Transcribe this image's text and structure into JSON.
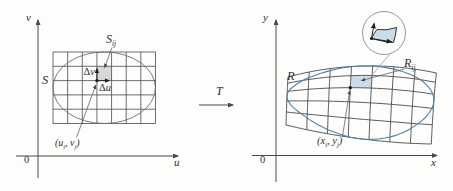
{
  "figure": {
    "left": {
      "v_axis_label": "v",
      "u_axis_label": "u",
      "origin_label": "0",
      "region_label": "S",
      "cell_label": {
        "base": "S",
        "sub": "ij"
      },
      "dv_label": {
        "delta": "Δ",
        "var": "v"
      },
      "du_label": {
        "delta": "Δ",
        "var": "u"
      },
      "point_label": {
        "pre": "(u",
        "sub1": "i",
        "mid": ", v",
        "sub2": "j",
        "post": ")"
      }
    },
    "transform": {
      "label": "T"
    },
    "right": {
      "y_axis_label": "y",
      "x_axis_label": "x",
      "origin_label": "0",
      "region_label": "R",
      "cell_label": {
        "base": "R",
        "sub": "ij"
      },
      "point_label": {
        "pre": "(x",
        "sub1": "i",
        "mid": ", y",
        "sub2": "j",
        "post": ")"
      }
    },
    "colors": {
      "line": "#4a4a4a",
      "ellipse": "#6e6e6e",
      "leader": "#5a5a5a",
      "blue": "#4d83aa",
      "patch_fill": "#c9dcea",
      "cell_fill": "#d8d8d8",
      "circle_stroke": "#9a9a9a",
      "black": "#1c1c1c"
    }
  }
}
